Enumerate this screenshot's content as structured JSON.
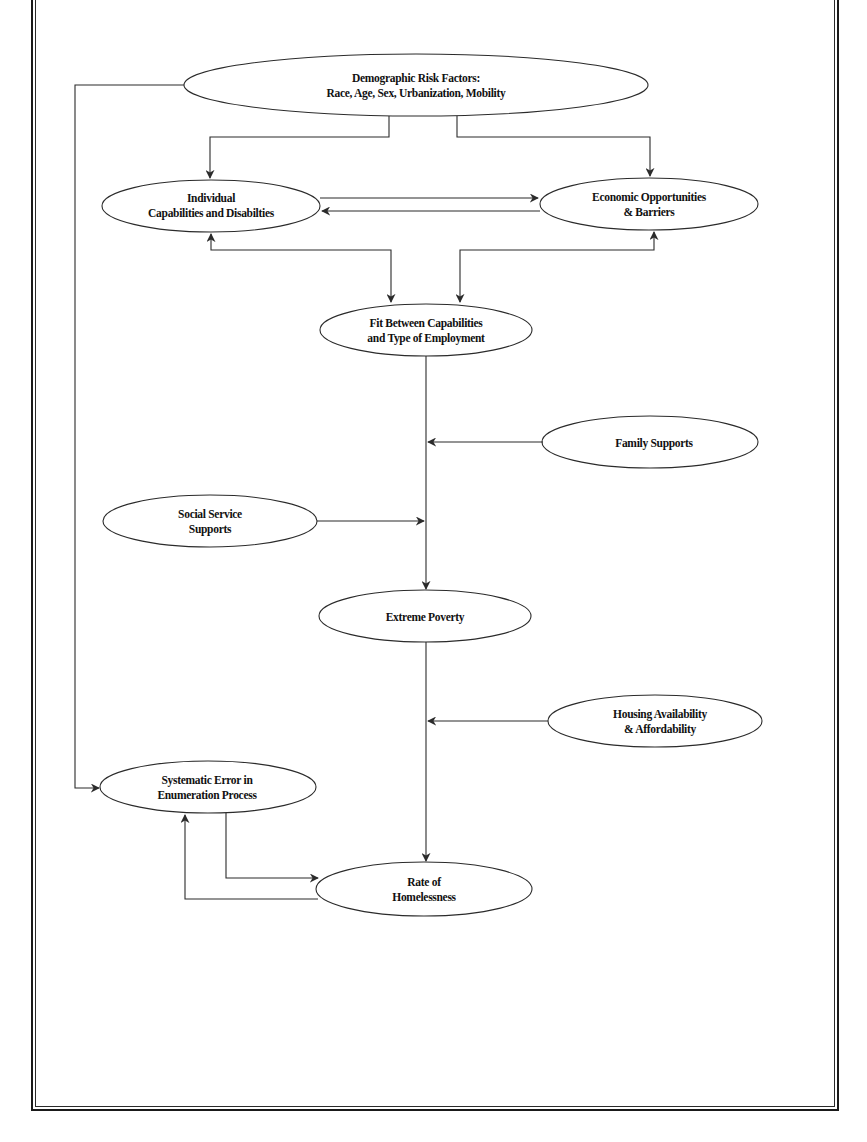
{
  "diagram": {
    "nodes": {
      "demographic": {
        "line1": "Demographic Risk Factors:",
        "line2": "Race, Age, Sex, Urbanization, Mobility"
      },
      "individual": {
        "line1": "Individual",
        "line2": "Capabilities and  Disabilties"
      },
      "economic": {
        "line1": "Economic Opportunities",
        "line2": "& Barriers"
      },
      "fit": {
        "line1": "Fit Between Capabilities",
        "line2": "and Type of Employment"
      },
      "family": {
        "line1": "Family Supports"
      },
      "social": {
        "line1": "Social Service",
        "line2": "Supports"
      },
      "poverty": {
        "line1": "Extreme Poverty"
      },
      "housing": {
        "line1": "Housing Availability",
        "line2": "& Affordability"
      },
      "systematic": {
        "line1": "Systematic Error in",
        "line2": "Enumeration Process"
      },
      "homelessness": {
        "line1": "Rate of",
        "line2": "Homelessness"
      }
    },
    "edges": [
      {
        "from": "demographic",
        "to": "individual"
      },
      {
        "from": "demographic",
        "to": "economic"
      },
      {
        "from": "demographic",
        "to": "systematic"
      },
      {
        "from": "individual",
        "to": "economic"
      },
      {
        "from": "economic",
        "to": "individual"
      },
      {
        "from": "individual",
        "to": "fit",
        "bidirectional": true
      },
      {
        "from": "economic",
        "to": "fit",
        "bidirectional": true
      },
      {
        "from": "fit",
        "to": "poverty"
      },
      {
        "from": "family",
        "to": "fit-poverty-link"
      },
      {
        "from": "social",
        "to": "fit-poverty-link"
      },
      {
        "from": "poverty",
        "to": "homelessness"
      },
      {
        "from": "housing",
        "to": "poverty-homelessness-link"
      },
      {
        "from": "systematic",
        "to": "homelessness"
      },
      {
        "from": "homelessness",
        "to": "systematic"
      }
    ],
    "colors": {
      "stroke": "#2b2b2b",
      "text": "#111111",
      "background": "#ffffff"
    }
  }
}
